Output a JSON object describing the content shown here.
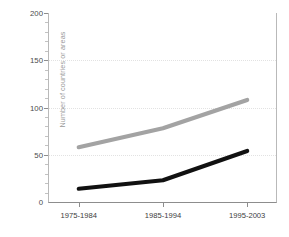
{
  "chart_data": {
    "type": "line",
    "title": "",
    "xlabel": "",
    "ylabel": "Number of countries or areas",
    "categories": [
      "1975-1984",
      "1985-1994",
      "1995-2003"
    ],
    "ylim": [
      0,
      200
    ],
    "yticks": [
      0,
      50,
      100,
      150,
      200
    ],
    "yticklabels": [
      "0",
      "50",
      "100",
      "150",
      "200"
    ],
    "yminorticks": [
      10,
      20,
      30,
      40,
      60,
      70,
      80,
      90,
      110,
      120,
      130,
      140,
      160,
      170,
      180,
      190
    ],
    "grid": "horizontal-dotted",
    "legend": "none",
    "series": [
      {
        "name": "gray-series",
        "color": "#a3a3a3",
        "values": [
          58,
          78,
          108
        ]
      },
      {
        "name": "black-series",
        "color": "#111111",
        "values": [
          14,
          23,
          54
        ]
      }
    ]
  },
  "axis": {
    "ylabel": "Number of countries or areas"
  },
  "colors": {
    "gray_series": "#a3a3a3",
    "black_series": "#111111",
    "gridline": "#e2e2e2",
    "axis": "#8d8d8d",
    "background": "#ffffff"
  }
}
